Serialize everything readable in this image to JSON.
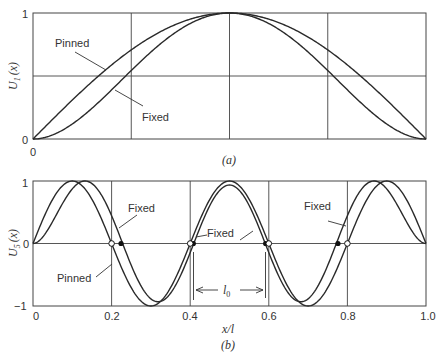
{
  "chart_data": [
    {
      "type": "line",
      "panel_caption": "(a)",
      "title": "",
      "xlabel": "",
      "ylabel": "U1(x)",
      "xlim": [
        0,
        1
      ],
      "ylim": [
        0,
        1
      ],
      "grid": true,
      "x_ticks": [
        "0"
      ],
      "y_ticks": [
        "0",
        "1"
      ],
      "x_gridlines": [
        0.25,
        0.5,
        0.75
      ],
      "y_gridlines": [
        0.5
      ],
      "series": [
        {
          "name": "Pinned",
          "function": "sin(pi*x)",
          "x": [
            0,
            0.1,
            0.2,
            0.25,
            0.3,
            0.4,
            0.5,
            0.6,
            0.7,
            0.75,
            0.8,
            0.9,
            1.0
          ],
          "values": [
            0,
            0.31,
            0.59,
            0.71,
            0.81,
            0.95,
            1.0,
            0.95,
            0.81,
            0.71,
            0.59,
            0.31,
            0
          ]
        },
        {
          "name": "Fixed",
          "function": "clamped-clamped beam mode 1",
          "x": [
            0,
            0.1,
            0.2,
            0.25,
            0.3,
            0.4,
            0.5,
            0.6,
            0.7,
            0.75,
            0.8,
            0.9,
            1.0
          ],
          "values": [
            0,
            0.12,
            0.38,
            0.51,
            0.64,
            0.88,
            1.0,
            0.88,
            0.64,
            0.51,
            0.38,
            0.12,
            0
          ]
        }
      ],
      "annotations": [
        {
          "text": "Pinned",
          "points_to": "Pinned curve near x=0.25"
        },
        {
          "text": "Fixed",
          "points_to": "Fixed curve near x=0.25"
        }
      ]
    },
    {
      "type": "line",
      "panel_caption": "(b)",
      "title": "",
      "xlabel": "x/l",
      "ylabel": "U5(x)",
      "xlim": [
        0,
        1
      ],
      "ylim": [
        -1,
        1
      ],
      "grid": true,
      "x_ticks": [
        "0",
        "0.2",
        "0.4",
        "0.6",
        "0.8",
        "1.0"
      ],
      "y_ticks": [
        "-1",
        "0",
        "1"
      ],
      "x_gridlines": [
        0.2,
        0.4,
        0.6,
        0.8
      ],
      "y_gridlines": [
        0
      ],
      "series": [
        {
          "name": "Pinned",
          "function": "sin(5*pi*x)",
          "zero_crossings": [
            0,
            0.2,
            0.4,
            0.6,
            0.8,
            1.0
          ],
          "peaks": [
            {
              "x": 0.1,
              "y": 1
            },
            {
              "x": 0.3,
              "y": -1
            },
            {
              "x": 0.5,
              "y": 1
            },
            {
              "x": 0.7,
              "y": -1
            },
            {
              "x": 0.9,
              "y": 1
            }
          ]
        },
        {
          "name": "Fixed",
          "function": "clamped-clamped beam mode 5",
          "zero_crossings": [
            0,
            0.224,
            0.408,
            0.592,
            0.776,
            1.0
          ],
          "peaks": [
            {
              "x": 0.13,
              "y": 1
            },
            {
              "x": 0.316,
              "y": -1
            },
            {
              "x": 0.5,
              "y": 1
            },
            {
              "x": 0.684,
              "y": -1
            },
            {
              "x": 0.87,
              "y": 1
            }
          ]
        }
      ],
      "annotations": [
        {
          "text": "Fixed",
          "points_to": "Fixed curve near x=0.22"
        },
        {
          "text": "Pinned",
          "points_to": "Pinned curve near x=0.2"
        },
        {
          "text": "Fixed",
          "points_to": "Fixed curve near x=0.42"
        },
        {
          "text": "Fixed",
          "points_to": "Fixed curve near x=0.78"
        },
        {
          "text": "l0",
          "dimension": "distance between Fixed zero crossings at x≈0.408 and x≈0.592"
        }
      ],
      "markers": {
        "open_circle": "Pinned nodes",
        "filled_circle": "Fixed nodes"
      }
    }
  ],
  "labels": {
    "a": {
      "caption": "(a)",
      "ylabel_main": "U",
      "ylabel_sub": "1",
      "ylabel_arg": "(x)",
      "y0": "0",
      "y1": "1",
      "x0": "0",
      "pinned": "Pinned",
      "fixed": "Fixed"
    },
    "b": {
      "caption": "(b)",
      "ylabel_main": "U",
      "ylabel_sub": "5",
      "ylabel_arg": "(x)",
      "ym1": "−1",
      "y0": "0",
      "y1": "1",
      "xt0": "0",
      "xt1": "0.2",
      "xt2": "0.4",
      "xt3": "0.6",
      "xt4": "0.8",
      "xt5": "1.0",
      "xlabel": "x/l",
      "fixed1": "Fixed",
      "pinned": "Pinned",
      "fixed2": "Fixed",
      "fixed3": "Fixed",
      "l0": "l",
      "l0_sub": "0"
    }
  },
  "colors": {
    "line": "#2a2a2a",
    "grid": "#444444",
    "background": "#ffffff"
  }
}
